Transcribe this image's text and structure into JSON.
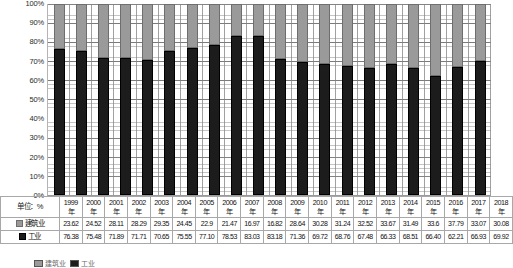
{
  "chart_data": {
    "type": "bar",
    "subtype": "stacked-percentage-column",
    "title": "",
    "subtitle": "",
    "xlabel": "",
    "ylabel": "",
    "unit_label": "单位：%",
    "ylim": [
      0,
      100
    ],
    "ytick_labels": [
      "100%",
      "90%",
      "80%",
      "70%",
      "60%",
      "50%",
      "40%",
      "30%",
      "20%",
      "10%",
      "0%"
    ],
    "ytick_values": [
      100,
      90,
      80,
      70,
      60,
      50,
      40,
      30,
      20,
      10,
      0
    ],
    "grid": true,
    "legend_position": "bottom",
    "categories": [
      "1999年",
      "2000年",
      "2001年",
      "2002年",
      "2003年",
      "2004年",
      "2005年",
      "2006年",
      "2007年",
      "2008年",
      "2009年",
      "2010年",
      "2011年",
      "2012年",
      "2013年",
      "2014年",
      "2015年",
      "2016年",
      "2017年",
      "2018年"
    ],
    "category_years": [
      "1999",
      "2000",
      "2001",
      "2002",
      "2003",
      "2004",
      "2005",
      "2006",
      "2007",
      "2008",
      "2009",
      "2010",
      "2011",
      "2012",
      "2013",
      "2014",
      "2015",
      "2016",
      "2017",
      "2018"
    ],
    "category_suffix": "年",
    "series": [
      {
        "name": "建筑业",
        "color": "#9a9a9a",
        "stack_position": "top",
        "values": [
          23.62,
          24.52,
          28.11,
          28.29,
          29.35,
          24.45,
          22.9,
          21.47,
          16.97,
          16.82,
          28.64,
          30.28,
          31.24,
          32.52,
          33.67,
          31.49,
          33.6,
          37.79,
          33.07,
          30.08
        ],
        "value_labels": [
          "23.62",
          "24.52",
          "28.11",
          "28.29",
          "29.35",
          "24.45",
          "22.9",
          "21.47",
          "16.97",
          "16.82",
          "28.64",
          "30.28",
          "31.24",
          "32.52",
          "33.67",
          "31.49",
          "33.6",
          "37.79",
          "33.07",
          "30.08"
        ]
      },
      {
        "name": "工业",
        "color": "#1c1c1c",
        "stack_position": "bottom",
        "values": [
          76.38,
          75.48,
          71.89,
          71.71,
          70.65,
          75.55,
          77.1,
          78.53,
          83.03,
          83.18,
          71.36,
          69.72,
          68.76,
          67.48,
          66.33,
          68.51,
          66.4,
          62.21,
          66.93,
          69.92
        ],
        "value_labels": [
          "76.38",
          "75.48",
          "71.89",
          "71.71",
          "70.65",
          "75.55",
          "77.10",
          "78.53",
          "83.03",
          "83.18",
          "71.36",
          "69.72",
          "68.76",
          "67.48",
          "66.33",
          "68.51",
          "66.40",
          "62.21",
          "66.93",
          "69.92"
        ]
      }
    ]
  },
  "table": {
    "unit_cell": "单位：%",
    "row_labels": [
      "建筑业",
      "工业"
    ]
  },
  "legend": {
    "items": [
      {
        "label": "建筑业",
        "color": "#9a9a9a"
      },
      {
        "label": "工业",
        "color": "#1c1c1c"
      }
    ]
  }
}
